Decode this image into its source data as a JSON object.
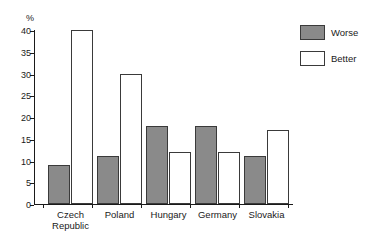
{
  "chart_data": {
    "type": "bar",
    "title": "",
    "xlabel": "",
    "ylabel": "%",
    "ylim": [
      0,
      40
    ],
    "yticks": [
      0,
      5,
      10,
      15,
      20,
      25,
      30,
      35,
      40
    ],
    "ytick_labels": [
      "0",
      "5",
      "10",
      "15",
      "20",
      "25",
      "30",
      "35",
      "40"
    ],
    "grid": false,
    "legend_position": "right",
    "categories": [
      "Czech\nRepublic",
      "Poland",
      "Hungary",
      "Germany",
      "Slovakia"
    ],
    "series": [
      {
        "name": "Worse",
        "color": "#8a8a8a",
        "values": [
          9,
          11,
          18,
          18,
          11
        ]
      },
      {
        "name": "Better",
        "color": "#ffffff",
        "values": [
          40,
          30,
          12,
          12,
          17
        ]
      }
    ]
  },
  "colors": {
    "worse_fill": "#8a8a8a",
    "better_fill": "#ffffff",
    "bar_stroke": "#3a3a3a",
    "axis": "#1a1a1a",
    "background": "#ffffff"
  }
}
